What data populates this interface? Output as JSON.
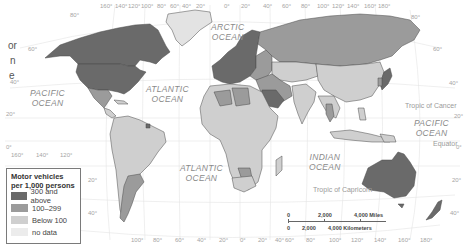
{
  "title_fragment": [
    "or",
    "n",
    "e"
  ],
  "legend": {
    "title_line1": "Motor vehicles",
    "title_line2": "per 1,000 persons",
    "items": [
      {
        "label": "300 and above",
        "color": "#6a6a6a"
      },
      {
        "label": "100–299",
        "color": "#9b9b9b"
      },
      {
        "label": "Below 100",
        "color": "#cfcfcf"
      },
      {
        "label": "no data",
        "color": "#ececec"
      }
    ]
  },
  "oceans": {
    "arctic": [
      "ARCTIC",
      "OCEAN"
    ],
    "atlantic_north": [
      "ATLANTIC",
      "OCEAN"
    ],
    "atlantic_south": [
      "ATLANTIC",
      "OCEAN"
    ],
    "pacific_west": [
      "PACIFIC",
      "OCEAN"
    ],
    "pacific_east": [
      "PACIFIC",
      "OCEAN"
    ],
    "indian": [
      "INDIAN",
      "OCEAN"
    ]
  },
  "reference_lines": {
    "tropic_cancer": "Tropic of Cancer",
    "equator": "Equator",
    "tropic_capricorn": "Tropic of Capricorn"
  },
  "graticule": {
    "top": [
      "160°",
      "140°",
      "120°",
      "100°",
      "80°",
      "60°",
      "40°",
      "20°",
      "0°",
      "20°",
      "40°",
      "60°",
      "80°",
      "100°",
      "120°",
      "140°",
      "160°",
      "180°"
    ],
    "bottom": [
      "100°",
      "80°",
      "60°",
      "40°",
      "20°",
      "0°",
      "20°",
      "40°",
      "60°",
      "80°",
      "100°",
      "120°",
      "140°",
      "160°",
      "180°"
    ],
    "left_lat": [
      "80°",
      "60°",
      "40°",
      "20°",
      "0°",
      "20°",
      "40°"
    ],
    "right_lat": [
      "80°",
      "60°",
      "40°",
      "20°",
      "0°",
      "20°",
      "40°"
    ],
    "pacific_lon": [
      "160°",
      "140°",
      "120°"
    ]
  },
  "scale": {
    "miles": [
      "0",
      "2,000",
      "4,000 Miles"
    ],
    "km": [
      "0",
      "2,000",
      "4,000 Kilometers"
    ]
  },
  "colors": {
    "high": "#6a6a6a",
    "mid": "#9b9b9b",
    "low": "#cfcfcf",
    "nodata": "#ececec",
    "border": "#4a4a4a",
    "graticule": "#e2e2e2"
  }
}
